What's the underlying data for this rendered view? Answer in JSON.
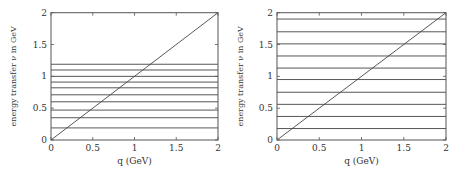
{
  "chart_data": [
    {
      "type": "line",
      "title": "",
      "xlabel": "q (GeV)",
      "ylabel": "energy transfer ν in GeV",
      "xlim": [
        0,
        2
      ],
      "ylim": [
        0,
        2
      ],
      "x_ticks": [
        "0",
        "0.5",
        "1",
        "1.5",
        "2"
      ],
      "y_ticks": [
        "0",
        "0.5",
        "1",
        "1.5",
        "2"
      ],
      "grid": false,
      "series": [
        {
          "name": "diagonal ν = q",
          "x": [
            0,
            2
          ],
          "y": [
            0,
            2
          ]
        },
        {
          "name": "horizontal levels",
          "y_values": [
            0.19,
            0.35,
            0.47,
            0.6,
            0.71,
            0.82,
            0.91,
            1.0,
            1.1,
            1.19
          ]
        }
      ]
    },
    {
      "type": "line",
      "title": "",
      "xlabel": "q (GeV)",
      "ylabel": "energy transfer ν in GeV",
      "xlim": [
        0,
        2
      ],
      "ylim": [
        0,
        2
      ],
      "x_ticks": [
        "0",
        "0.5",
        "1",
        "1.5",
        "2"
      ],
      "y_ticks": [
        "0",
        "0.5",
        "1",
        "1.5",
        "2"
      ],
      "grid": false,
      "series": [
        {
          "name": "diagonal ν = q",
          "x": [
            0,
            2
          ],
          "y": [
            0,
            2
          ]
        },
        {
          "name": "horizontal levels",
          "y_values": [
            0.18,
            0.37,
            0.56,
            0.75,
            0.95,
            1.13,
            1.32,
            1.51,
            1.7,
            1.9
          ]
        }
      ]
    }
  ],
  "colors": {
    "line": "#444444",
    "axis": "#555555",
    "text": "#333333"
  }
}
